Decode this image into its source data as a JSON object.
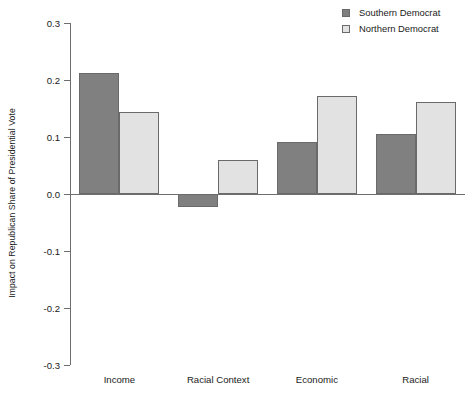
{
  "chart_data": {
    "type": "bar",
    "title": "",
    "xlabel": "",
    "ylabel": "Impact on Republican Share of Presidential Vote",
    "categories": [
      "Income",
      "Racial Context",
      "Economic",
      "Racial"
    ],
    "series": [
      {
        "name": "Southern Democrat",
        "color": "#808080",
        "values": [
          0.212,
          -0.023,
          0.091,
          0.105
        ]
      },
      {
        "name": "Northern Democrat",
        "color": "#e2e2e2",
        "values": [
          0.144,
          0.06,
          0.172,
          0.161
        ]
      }
    ],
    "ylim": [
      -0.3,
      0.3
    ],
    "yticks": [
      0.3,
      0.2,
      0.1,
      0.0,
      -0.1,
      -0.2,
      -0.3
    ],
    "ytick_labels": [
      "0.3",
      "0.2",
      "0.1",
      "0.0",
      "-0.1",
      "-0.2",
      "-0.3"
    ],
    "grid": false,
    "legend_position": "top-right",
    "zero_line": true
  },
  "legend": {
    "items": [
      {
        "label": "Southern Democrat",
        "swatch": "southern"
      },
      {
        "label": "Northern Democrat",
        "swatch": "northern"
      }
    ]
  },
  "axis": {
    "y_title": "Impact on Republican Share of Presidential Vote"
  }
}
